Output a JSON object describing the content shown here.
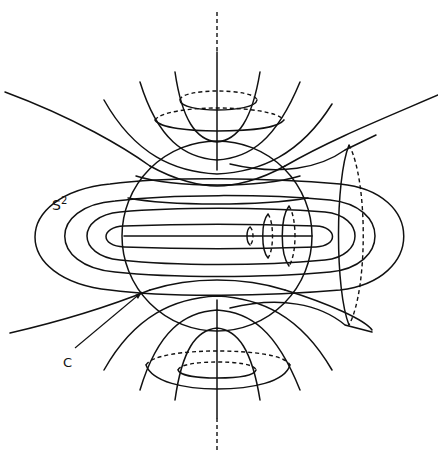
{
  "figure": {
    "type": "topology-diagram",
    "stroke_color": "#111111",
    "background": "#ffffff"
  },
  "labels": {
    "sphere": {
      "base": "S",
      "sup": "2"
    },
    "circle": "C"
  }
}
